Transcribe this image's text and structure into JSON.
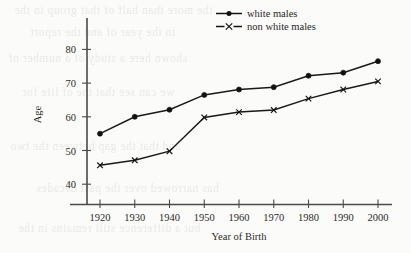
{
  "chart_data": {
    "type": "line",
    "title": "",
    "xlabel": "Year of Birth",
    "ylabel": "Age",
    "x": [
      1920,
      1930,
      1940,
      1950,
      1960,
      1970,
      1980,
      1990,
      2000
    ],
    "xtick_labels": [
      "1920",
      "1930",
      "1940",
      "1950",
      "1960",
      "1970",
      "1980",
      "1990",
      "2000"
    ],
    "ytick_labels": [
      "40",
      "50",
      "60",
      "70",
      "80"
    ],
    "yticks": [
      40,
      50,
      60,
      70,
      80
    ],
    "xlim": [
      1915,
      2005
    ],
    "ylim": [
      34,
      84
    ],
    "grid": false,
    "legend_position": "top-right",
    "series": [
      {
        "name": "white males",
        "marker": "filled-circle",
        "color": "#121212",
        "values": [
          55.0,
          60.0,
          62.1,
          66.5,
          68.1,
          68.8,
          72.2,
          73.1,
          76.5
        ]
      },
      {
        "name": "non white males",
        "marker": "cross",
        "color": "#121212",
        "values": [
          45.6,
          47.1,
          49.8,
          59.8,
          61.4,
          62.0,
          65.4,
          68.1,
          70.5
        ]
      }
    ]
  },
  "legend": {
    "items": [
      {
        "label": "white males",
        "marker": "filled-circle"
      },
      {
        "label": "non white males",
        "marker": "cross"
      }
    ]
  },
  "page_bleed": {
    "lines": [
      "the more than half of that group in the",
      "in the year of and the report",
      "shown here a study of a number of",
      "we can see that the of life for",
      "and that the gap between the two",
      "has narrowed over the past decades",
      "but a difference still remains in the"
    ]
  }
}
